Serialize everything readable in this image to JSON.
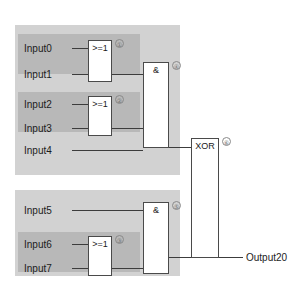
{
  "diagram": {
    "colors": {
      "panel": "#d2d2d2",
      "band": "#b8b8b8",
      "wire": "#3c3c3c",
      "gate_border": "#4a4a4a",
      "gate_fill": "#ffffff",
      "text": "#1c1c1c",
      "marker": "#6e6e6e",
      "background": "#ffffff"
    },
    "inputs": [
      {
        "label": "Input0"
      },
      {
        "label": "Input1"
      },
      {
        "label": "Input2"
      },
      {
        "label": "Input3"
      },
      {
        "label": "Input4"
      },
      {
        "label": "Input5"
      },
      {
        "label": "Input6"
      },
      {
        "label": "Input7"
      }
    ],
    "outputs": [
      {
        "label": "Output20"
      }
    ],
    "gates": [
      {
        "label": ">=1",
        "marker": "①",
        "type": "or"
      },
      {
        "label": ">=1",
        "marker": "②",
        "type": "or"
      },
      {
        "label": "&",
        "marker": "④",
        "type": "and"
      },
      {
        "label": "&",
        "marker": "⑤",
        "type": "and"
      },
      {
        "label": ">=1",
        "marker": "③",
        "type": "or"
      },
      {
        "label": "XOR",
        "marker": "⑥",
        "type": "xor"
      }
    ]
  }
}
